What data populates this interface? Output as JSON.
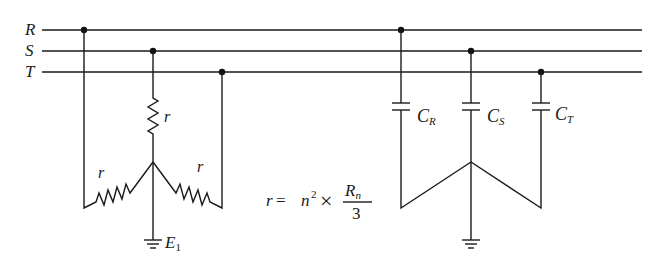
{
  "diagram": {
    "type": "circuit",
    "buses": [
      {
        "name": "R",
        "y": 30
      },
      {
        "name": "S",
        "y": 51
      },
      {
        "name": "T",
        "y": 72
      }
    ],
    "left_network": {
      "kind": "star-connected resistors",
      "resistor_label": "r",
      "resistors": [
        {
          "phase": "S",
          "label": "r",
          "position": "top"
        },
        {
          "phase": "R",
          "label": "r",
          "position": "left"
        },
        {
          "phase": "T",
          "label": "r",
          "position": "right"
        }
      ],
      "ground_label": "E",
      "ground_subscript": "1"
    },
    "formula": {
      "lhs": "r",
      "eq": "=",
      "n": "n",
      "power": "2",
      "times": "×",
      "num_main": "R",
      "num_sub": "n",
      "den": "3"
    },
    "right_network": {
      "kind": "star-connected capacitors",
      "capacitors": [
        {
          "phase": "R",
          "label": "C",
          "subscript": "R"
        },
        {
          "phase": "S",
          "label": "C",
          "subscript": "S"
        },
        {
          "phase": "T",
          "label": "C",
          "subscript": "T"
        }
      ],
      "grounded": true
    }
  }
}
